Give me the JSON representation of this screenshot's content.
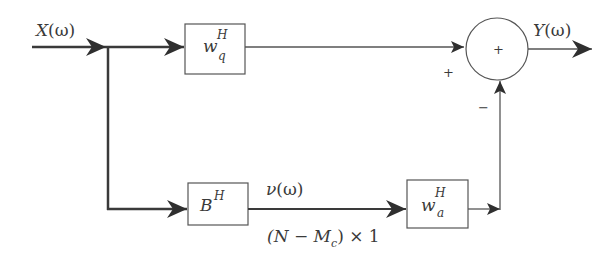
{
  "diagram": {
    "type": "block-diagram",
    "input": {
      "label_base": "X",
      "label_arg": "(ω)"
    },
    "output": {
      "label_base": "Y",
      "label_arg": "(ω)"
    },
    "blocks": [
      {
        "id": "wq",
        "base": "w",
        "sup": "H",
        "sub": "q"
      },
      {
        "id": "B",
        "base": "B",
        "sup": "H"
      },
      {
        "id": "wa",
        "base": "w",
        "sup": "H",
        "sub": "a"
      }
    ],
    "summer": {
      "symbol": "+",
      "input_signs": {
        "top": "+",
        "bottom": "−"
      }
    },
    "signal": {
      "name_base": "ν",
      "name_arg": "(ω)",
      "dimension_open": "(N − M",
      "dimension_sub": "c",
      "dimension_close": ") × 1"
    },
    "colors": {
      "line": "#3a3a3a",
      "background": "#ffffff"
    }
  }
}
